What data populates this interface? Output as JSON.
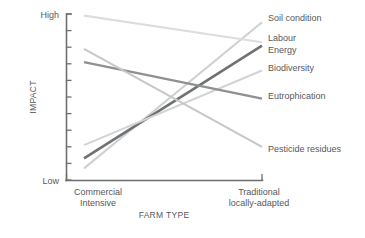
{
  "chart_data": {
    "type": "line",
    "title": "",
    "xlabel": "FARM TYPE",
    "ylabel": "IMPACT",
    "categories": [
      "Commercial Intensive",
      "Traditional locally-adapted"
    ],
    "category_lines": [
      [
        "Commercial",
        "Intensive"
      ],
      [
        "Traditional",
        "locally-adapted"
      ]
    ],
    "ytick_labels": [
      "High",
      "Low"
    ],
    "ylim": [
      0,
      100
    ],
    "ytick_count": 10,
    "grid": false,
    "legend": "right-inline-labels",
    "series": [
      {
        "name": "Soil condition",
        "values": [
          7,
          95
        ],
        "color": "#cfd0d1",
        "width": 2.1
      },
      {
        "name": "Labour",
        "values": [
          13,
          81
        ],
        "color": "#6f7173",
        "width": 2.6
      },
      {
        "name": "Energy",
        "values": [
          13,
          81
        ],
        "color": "#6f7173",
        "width": 2.6
      },
      {
        "name": "Biodiversity",
        "values": [
          21,
          66
        ],
        "color": "#d2d3d4",
        "width": 2.1
      },
      {
        "name": "Eutrophication",
        "values": [
          71,
          49
        ],
        "color": "#8e9092",
        "width": 2.4
      },
      {
        "name": "Pesticide residues",
        "values": [
          79,
          20
        ],
        "color": "#c6c7c8",
        "width": 2.1
      },
      {
        "name": "descending-light",
        "values": [
          99,
          83
        ],
        "color": "#dcdddd",
        "width": 2.1
      }
    ],
    "series_labels": [
      {
        "text": "Soil condition",
        "x": 268,
        "y": 21
      },
      {
        "text": "Labour",
        "x": 268,
        "y": 41
      },
      {
        "text": "Energy",
        "x": 268,
        "y": 53
      },
      {
        "text": "Biodiversity",
        "x": 268,
        "y": 71
      },
      {
        "text": "Eutrophication",
        "x": 268,
        "y": 99
      },
      {
        "text": "Pesticide residues",
        "x": 268,
        "y": 152
      }
    ]
  },
  "axes": {
    "y_high_label": "High",
    "y_low_label": "Low",
    "y_axis_title": "IMPACT",
    "x_axis_title": "FARM TYPE"
  }
}
